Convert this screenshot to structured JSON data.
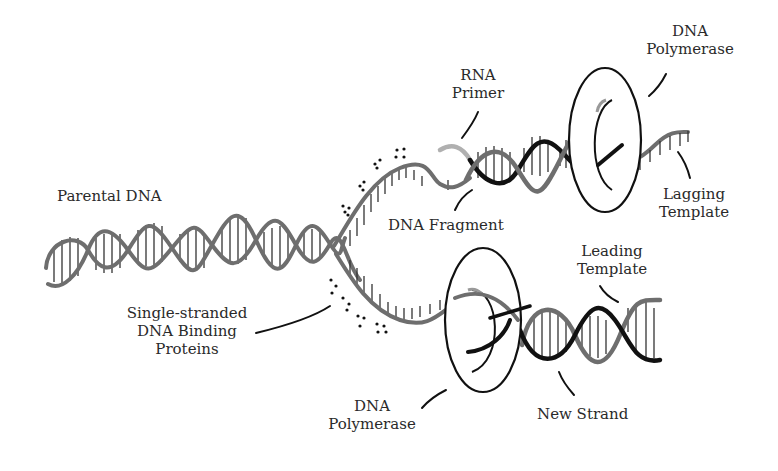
{
  "diagram": {
    "colors": {
      "parental_strand": "#6e6e6e",
      "new_strand": "#1a1a1a",
      "rna_primer": "#b0b0b0",
      "polymerase_outline": "#111111",
      "rungs": "#333333",
      "ssb_dots": "#111111",
      "background": "#ffffff"
    },
    "labels": {
      "parental_dna": {
        "lines": [
          "Parental DNA"
        ]
      },
      "ssb_proteins": {
        "lines": [
          "Single-stranded",
          "DNA Binding",
          "Proteins"
        ]
      },
      "rna_primer": {
        "lines": [
          "RNA",
          "Primer"
        ]
      },
      "dna_fragment": {
        "lines": [
          "DNA Fragment"
        ]
      },
      "polymerase_top": {
        "lines": [
          "DNA",
          "Polymerase"
        ]
      },
      "lagging_template": {
        "lines": [
          "Lagging",
          "Template"
        ]
      },
      "leading_template": {
        "lines": [
          "Leading",
          "Template"
        ]
      },
      "polymerase_bottom": {
        "lines": [
          "DNA",
          "Polymerase"
        ]
      },
      "new_strand": {
        "lines": [
          "New Strand"
        ]
      }
    }
  }
}
